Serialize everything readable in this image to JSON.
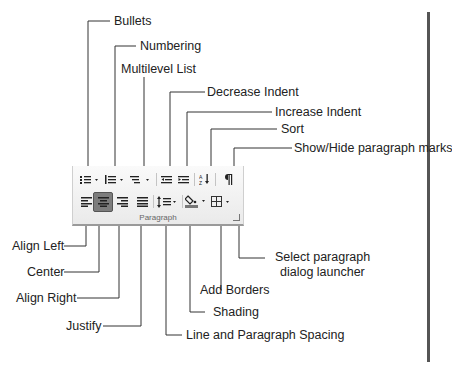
{
  "ribbon": {
    "group_label": "Paragraph",
    "row1_buttons": [
      {
        "name": "bullets",
        "icon": "bullets-icon",
        "has_dropdown": true
      },
      {
        "name": "numbering",
        "icon": "numbering-icon",
        "has_dropdown": true
      },
      {
        "name": "multilevel-list",
        "icon": "multilevel-list-icon",
        "has_dropdown": true
      },
      {
        "name": "decrease-indent",
        "icon": "decrease-indent-icon"
      },
      {
        "name": "increase-indent",
        "icon": "increase-indent-icon"
      },
      {
        "name": "sort",
        "icon": "sort-icon"
      },
      {
        "name": "show-hide",
        "icon": "pilcrow-icon"
      }
    ],
    "row2_buttons": [
      {
        "name": "align-left",
        "icon": "align-left-icon"
      },
      {
        "name": "center",
        "icon": "align-center-icon",
        "selected": true
      },
      {
        "name": "align-right",
        "icon": "align-right-icon"
      },
      {
        "name": "justify",
        "icon": "justify-icon"
      },
      {
        "name": "line-spacing",
        "icon": "line-spacing-icon",
        "has_dropdown": true
      },
      {
        "name": "shading",
        "icon": "shading-icon",
        "has_dropdown": true
      },
      {
        "name": "borders",
        "icon": "borders-icon",
        "has_dropdown": true
      }
    ]
  },
  "callouts": {
    "bullets": "Bullets",
    "numbering": "Numbering",
    "multilevel": "Multilevel List",
    "decrease_indent": "Decrease Indent",
    "increase_indent": "Increase Indent",
    "sort": "Sort",
    "show_hide": "Show/Hide paragraph marks",
    "align_left": "Align Left",
    "center": "Center",
    "align_right": "Align Right",
    "justify": "Justify",
    "line_spacing": "Line and Paragraph Spacing",
    "shading": "Shading",
    "add_borders": "Add Borders",
    "launcher_line1": "Select paragraph",
    "launcher_line2": "dialog launcher"
  },
  "colors": {
    "line": "#333333",
    "ribbon_bg": "#f2f2f2",
    "selected_button": "#7d7d7d"
  }
}
